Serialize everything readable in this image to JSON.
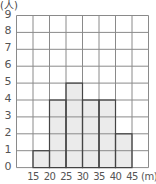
{
  "chart_data": {
    "type": "bar",
    "subtype": "histogram",
    "title": "",
    "xlabel": "(m)",
    "ylabel": "(人)",
    "x_unit": "(m)",
    "y_unit": "(人)",
    "bins": [
      {
        "from": 15,
        "to": 20,
        "count": 1
      },
      {
        "from": 20,
        "to": 25,
        "count": 4
      },
      {
        "from": 25,
        "to": 30,
        "count": 5
      },
      {
        "from": 30,
        "to": 35,
        "count": 4
      },
      {
        "from": 35,
        "to": 40,
        "count": 4
      },
      {
        "from": 40,
        "to": 45,
        "count": 2
      }
    ],
    "categories": [
      "15-20",
      "20-25",
      "25-30",
      "30-35",
      "35-40",
      "40-45"
    ],
    "values": [
      1,
      4,
      5,
      4,
      4,
      2
    ],
    "x_tick_labels": [
      "15",
      "20",
      "25",
      "30",
      "35",
      "40",
      "45"
    ],
    "y_tick_labels": [
      "0",
      "1",
      "2",
      "3",
      "4",
      "5",
      "6",
      "7",
      "8",
      "9"
    ],
    "ylim": [
      0,
      9
    ],
    "xlim_columns": 8,
    "grid": true,
    "legend": null,
    "colors": {
      "bar_fill": "#ebebeb",
      "bar_stroke": "#444444",
      "grid": "#8a8a8a"
    }
  }
}
